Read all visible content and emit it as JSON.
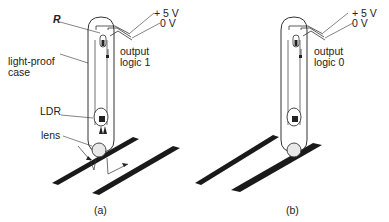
{
  "figure_a": {
    "caption": "(a)",
    "labels": {
      "resistor": "R",
      "supply_positive": "+ 5 V",
      "supply_ground": "0 V",
      "output_line1": "output",
      "output_line2": "logic 1",
      "case_line1": "light-proof",
      "case_line2": "case",
      "ldr": "LDR",
      "lens": "lens"
    }
  },
  "figure_b": {
    "caption": "(b)",
    "labels": {
      "supply_positive": "+ 5 V",
      "supply_ground": "0 V",
      "output_line1": "output",
      "output_line2": "logic 0"
    }
  },
  "colors": {
    "line": "#333333",
    "bar": "#1a1a1a",
    "background": "#ffffff"
  }
}
